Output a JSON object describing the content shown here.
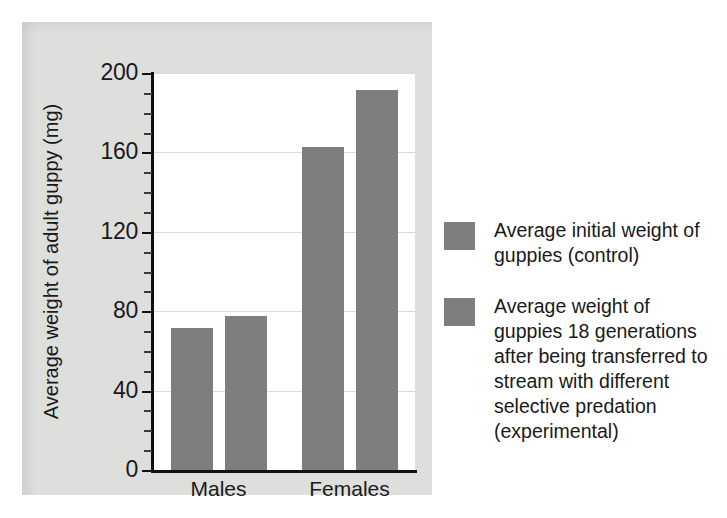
{
  "chart_data": {
    "type": "bar",
    "title": "",
    "xlabel": "",
    "ylabel": "Average weight of adult guppy (mg)",
    "ylim": [
      0,
      200
    ],
    "ytick_labels": [
      "0",
      "40",
      "80",
      "120",
      "160",
      "200"
    ],
    "ytick_values": [
      0,
      40,
      80,
      120,
      160,
      200
    ],
    "yminor_step": 10,
    "grid": true,
    "grid_axis": "y",
    "legend_position": "right",
    "categories": [
      "Males",
      "Females"
    ],
    "series": [
      {
        "name": "Average initial weight of guppies (control)",
        "short_name": "control",
        "color": "#7e7e7e",
        "values": [
          72,
          163
        ]
      },
      {
        "name": "Average weight of guppies 18 generations after being transferred to stream with different selective predation (experimental)",
        "short_name": "experimental",
        "color": "#7e7e7e",
        "values": [
          78,
          192
        ]
      }
    ],
    "bars": [
      {
        "category": "Males",
        "series": "control",
        "value": 72
      },
      {
        "category": "Males",
        "series": "experimental",
        "value": 78
      },
      {
        "category": "Females",
        "series": "control",
        "value": 163
      },
      {
        "category": "Females",
        "series": "experimental",
        "value": 192
      }
    ]
  },
  "legend": {
    "items": [
      {
        "label": "Average initial weight of guppies (control)",
        "color": "#7e7e7e"
      },
      {
        "label": "Average weight of guppies 18 generations after being transferred to stream with different selective predation (experimental)",
        "color": "#7e7e7e"
      }
    ]
  },
  "colors": {
    "bar": "#7e7e7e",
    "panel_background": "#dededd",
    "plot_background": "#ffffff",
    "axis": "#111111",
    "gridline": "#d9d9d9",
    "text": "#1a1a1a",
    "page_background": "#ffffff"
  }
}
